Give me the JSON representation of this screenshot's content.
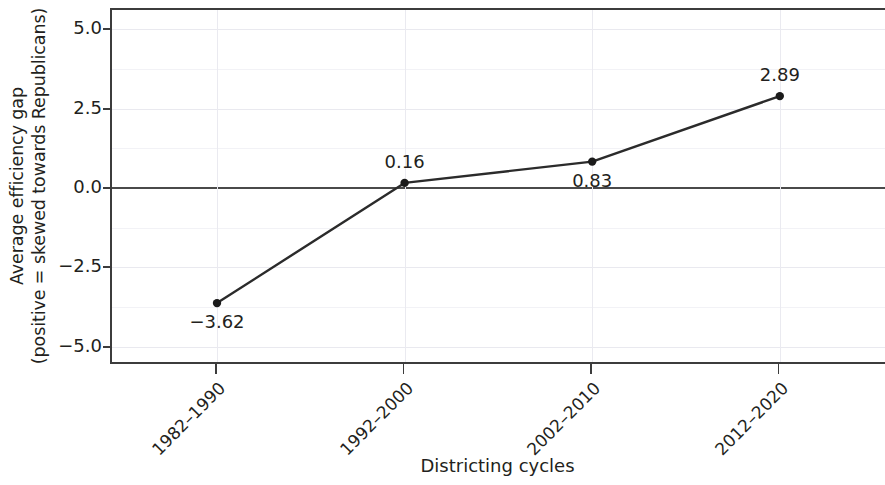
{
  "chart_data": {
    "type": "line",
    "title": "",
    "subtitle": "",
    "xlabel": "Districting cycles",
    "ylabel_line1": "Average efficiency gap",
    "ylabel_line2": "(positive = skewed towards Republicans)",
    "categories": [
      "1982–1990",
      "1992–2000",
      "2002–2010",
      "2012–2020"
    ],
    "values": [
      -3.62,
      0.16,
      0.83,
      2.89
    ],
    "point_labels": [
      "−3.62",
      "0.16",
      "0.83",
      "2.89"
    ],
    "point_label_position": [
      "below",
      "above",
      "below",
      "above"
    ],
    "yticks": [
      5.0,
      2.5,
      0.0,
      -2.5,
      -5.0
    ],
    "ytick_labels": [
      "5.0",
      "2.5",
      "0.0",
      "−2.5",
      "−5.0"
    ],
    "minor_yticks": [
      3.75,
      1.25,
      -1.25,
      -3.75
    ],
    "ylim": [
      -5.6,
      5.6
    ],
    "grid": true,
    "zero_line": true,
    "legend": "none",
    "series_color": "#2b2b2b",
    "marker_color": "#1a1a1a",
    "grid_color": "#e9e9ef",
    "axis_color": "#3c3c3c"
  }
}
